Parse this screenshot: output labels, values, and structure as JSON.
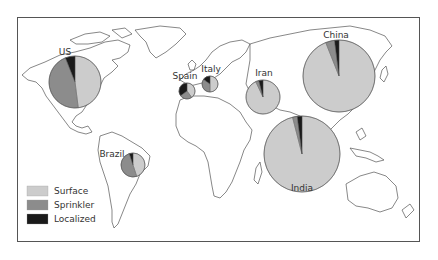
{
  "colors": {
    "surface": "#cccccc",
    "sprinkler": "#8c8c8c",
    "localized": "#1a1a1a",
    "pie_stroke": "#555555"
  },
  "legend": {
    "items": [
      {
        "label": "Surface",
        "color": "#cccccc"
      },
      {
        "label": "Sprinkler",
        "color": "#8c8c8c"
      },
      {
        "label": "Localized",
        "color": "#1a1a1a"
      }
    ]
  },
  "chart_data": {
    "type": "pie",
    "title": "",
    "categories": [
      "Surface",
      "Sprinkler",
      "Localized"
    ],
    "series": [
      {
        "name": "US",
        "cx": 75,
        "cy": 82,
        "r": 26,
        "values": [
          48,
          46,
          6
        ],
        "label_x": 65,
        "label_y": 55
      },
      {
        "name": "Spain",
        "cx": 187,
        "cy": 91,
        "r": 8,
        "values": [
          40,
          25,
          35
        ],
        "label_x": 185,
        "label_y": 79
      },
      {
        "name": "Italy",
        "cx": 210,
        "cy": 84,
        "r": 8,
        "values": [
          50,
          35,
          15
        ],
        "label_x": 211,
        "label_y": 72
      },
      {
        "name": "Iran",
        "cx": 263,
        "cy": 97,
        "r": 17,
        "values": [
          93,
          3,
          4
        ],
        "label_x": 264,
        "label_y": 76
      },
      {
        "name": "China",
        "cx": 339,
        "cy": 76,
        "r": 36,
        "values": [
          94,
          4,
          2
        ],
        "label_x": 336,
        "label_y": 38
      },
      {
        "name": "India",
        "cx": 302,
        "cy": 154,
        "r": 38,
        "values": [
          96,
          2,
          2
        ],
        "label_x": 302,
        "label_y": 191
      },
      {
        "name": "Brazil",
        "cx": 133,
        "cy": 165,
        "r": 12,
        "values": [
          45,
          50,
          5
        ],
        "label_x": 112,
        "label_y": 157
      }
    ],
    "legend_position": "bottom-left"
  }
}
